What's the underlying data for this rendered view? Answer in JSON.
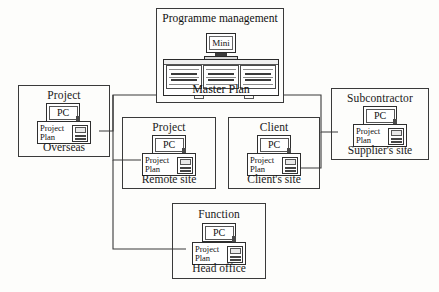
{
  "diagram": {
    "type": "network-topology",
    "central_node": {
      "title": "Programme management",
      "computer_label": "Mini",
      "data_label": "Master Plan",
      "icon": "mainframe-icon"
    },
    "nodes": [
      {
        "id": "overseas",
        "title": "Project",
        "pc_label": "PC",
        "plan_line1": "Project",
        "plan_line2": "Plan",
        "footer": "Overseas"
      },
      {
        "id": "remote-site",
        "title": "Project",
        "pc_label": "PC",
        "plan_line1": "Project",
        "plan_line2": "Plan",
        "footer": "Remote site"
      },
      {
        "id": "clients-site",
        "title": "Client",
        "pc_label": "PC",
        "plan_line1": "Project",
        "plan_line2": "Plan",
        "footer": "Client's site"
      },
      {
        "id": "suppliers-site",
        "title": "Subcontractor",
        "pc_label": "PC",
        "plan_line1": "Project",
        "plan_line2": "Plan",
        "footer": "Supplier's site"
      },
      {
        "id": "head-office",
        "title": "Function",
        "pc_label": "PC",
        "plan_line1": "Project",
        "plan_line2": "Plan",
        "footer": "Head office"
      }
    ],
    "colors": {
      "line": "#3a3a3a",
      "text": "#1a1a1a",
      "background": "#fdfdfb"
    }
  }
}
